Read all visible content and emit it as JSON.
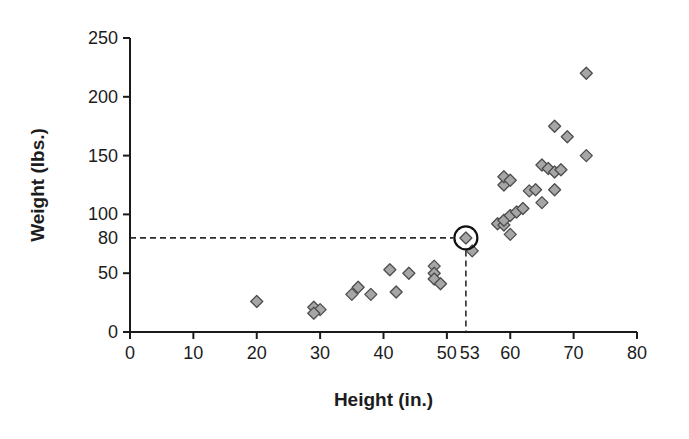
{
  "figure": {
    "xlabel": "Height (in.)",
    "ylabel": "Weight (lbs.)"
  },
  "chart_data": {
    "type": "scatter",
    "title": "",
    "xlabel": "Height (in.)",
    "ylabel": "Weight (lbs.)",
    "xlim": [
      0,
      80
    ],
    "ylim": [
      0,
      250
    ],
    "x_ticks": [
      0,
      10,
      20,
      30,
      40,
      50,
      60,
      70,
      80
    ],
    "y_ticks": [
      0,
      50,
      100,
      150,
      200,
      250
    ],
    "grid": false,
    "legend": false,
    "marker_shape": "diamond",
    "points": [
      [
        20,
        26
      ],
      [
        29,
        21
      ],
      [
        30,
        19
      ],
      [
        29,
        16
      ],
      [
        35,
        32
      ],
      [
        36,
        38
      ],
      [
        38,
        32
      ],
      [
        41,
        53
      ],
      [
        42,
        34
      ],
      [
        44,
        50
      ],
      [
        48,
        56
      ],
      [
        48,
        50
      ],
      [
        48,
        45
      ],
      [
        49,
        41
      ],
      [
        54,
        69
      ],
      [
        58,
        92
      ],
      [
        59,
        91
      ],
      [
        59,
        95
      ],
      [
        60,
        83
      ],
      [
        60,
        99
      ],
      [
        61,
        102
      ],
      [
        62,
        105
      ],
      [
        59,
        125
      ],
      [
        59,
        132
      ],
      [
        60,
        129
      ],
      [
        63,
        120
      ],
      [
        64,
        121
      ],
      [
        65,
        110
      ],
      [
        67,
        121
      ],
      [
        65,
        142
      ],
      [
        66,
        139
      ],
      [
        67,
        136
      ],
      [
        68,
        138
      ],
      [
        67,
        175
      ],
      [
        69,
        166
      ],
      [
        72,
        150
      ],
      [
        72,
        220
      ]
    ],
    "highlighted_point": {
      "x": 53,
      "y": 80,
      "x_axis_extra_label": "53",
      "y_axis_extra_label": "80",
      "annotation": "point circled, dashed guide lines drawn to both axes"
    },
    "colors": {
      "marker_fill": "#a6a6a6",
      "marker_stroke": "#4d4d4d",
      "axis": "#1a1a1a",
      "dashed_line": "#2b2b2b",
      "highlight_circle": "#111111"
    }
  }
}
